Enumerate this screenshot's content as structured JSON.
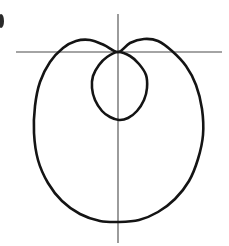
{
  "figure": {
    "background_color": "#ffffff",
    "curve_color": "#141414",
    "axis_color": "#4a4a4a",
    "curve_stroke_width": 2.6,
    "axis_stroke_width": 1.1,
    "width": 229,
    "height": 246
  },
  "chart_data": {
    "type": "line",
    "title": "",
    "xlabel": "",
    "ylabel": "",
    "subtitle": "",
    "grid": false,
    "legend": null,
    "curve_family": "limacon-with-inner-loop",
    "polar_equation": "r = b + a*cos(theta), a > b",
    "orientation": "loops open downward; cusp node at origin",
    "origin_px": [
      118,
      52
    ],
    "axes": {
      "x_axis": {
        "name": "horizontal-axis",
        "y_px": 52,
        "x_start_px": 16,
        "x_end_px": 222
      },
      "y_axis": {
        "name": "vertical-axis",
        "x_px": 118,
        "y_start_px": 14,
        "y_end_px": 243
      }
    },
    "outer_loop": {
      "name": "outer-loop",
      "left_extreme_px": [
        34,
        140
      ],
      "right_extreme_px": [
        203,
        138
      ],
      "bottom_extreme_px": [
        119,
        222
      ],
      "top_left_peak_px": [
        87,
        39
      ],
      "top_right_peak_px": [
        152,
        39
      ],
      "node_px": [
        118,
        52
      ],
      "width_px": 169,
      "height_px": 183
    },
    "inner_loop": {
      "name": "inner-loop",
      "left_extreme_px": [
        92,
        85
      ],
      "right_extreme_px": [
        147,
        85
      ],
      "bottom_extreme_px": [
        119,
        120
      ],
      "node_px": [
        118,
        52
      ],
      "width_px": 55,
      "height_px": 68
    },
    "series": [
      {
        "name": "outer-loop",
        "points_px": [
          [
            118,
            52
          ],
          [
            104,
            45
          ],
          [
            90,
            40
          ],
          [
            76,
            41
          ],
          [
            63,
            48
          ],
          [
            50,
            62
          ],
          [
            40,
            82
          ],
          [
            35,
            106
          ],
          [
            34,
            133
          ],
          [
            38,
            160
          ],
          [
            48,
            183
          ],
          [
            62,
            201
          ],
          [
            80,
            214
          ],
          [
            100,
            221
          ],
          [
            119,
            222
          ],
          [
            139,
            220
          ],
          [
            158,
            212
          ],
          [
            175,
            199
          ],
          [
            189,
            181
          ],
          [
            198,
            159
          ],
          [
            203,
            135
          ],
          [
            202,
            109
          ],
          [
            196,
            85
          ],
          [
            186,
            66
          ],
          [
            172,
            51
          ],
          [
            158,
            41
          ],
          [
            144,
            39
          ],
          [
            130,
            43
          ],
          [
            118,
            52
          ]
        ]
      },
      {
        "name": "inner-loop",
        "points_px": [
          [
            118,
            52
          ],
          [
            107,
            57
          ],
          [
            99,
            65
          ],
          [
            93,
            76
          ],
          [
            92,
            88
          ],
          [
            95,
            100
          ],
          [
            102,
            111
          ],
          [
            110,
            117
          ],
          [
            119,
            120
          ],
          [
            128,
            118
          ],
          [
            137,
            111
          ],
          [
            144,
            100
          ],
          [
            147,
            88
          ],
          [
            146,
            75
          ],
          [
            139,
            64
          ],
          [
            130,
            56
          ],
          [
            118,
            52
          ]
        ]
      }
    ]
  },
  "artifacts": {
    "edge_ink_mark": {
      "name": "edge-ink-mark",
      "description": "small clipped scan ink mark at left page edge",
      "x_px": 0,
      "y_px": 14,
      "width_px": 5,
      "height_px": 14,
      "color": "#2a2a2a"
    }
  }
}
